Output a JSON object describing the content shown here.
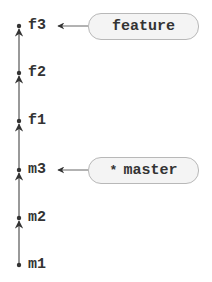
{
  "diagram": {
    "type": "git-commit-graph",
    "commits": [
      {
        "id": "f3",
        "label": "f3",
        "y": 26
      },
      {
        "id": "f2",
        "label": "f2",
        "y": 73
      },
      {
        "id": "f1",
        "label": "f1",
        "y": 121
      },
      {
        "id": "m3",
        "label": "m3",
        "y": 170
      },
      {
        "id": "m2",
        "label": "m2",
        "y": 218
      },
      {
        "id": "m1",
        "label": "m1",
        "y": 265
      }
    ],
    "edges": [
      {
        "from": "m1",
        "to": "m2"
      },
      {
        "from": "m2",
        "to": "m3"
      },
      {
        "from": "m3",
        "to": "f1"
      },
      {
        "from": "f1",
        "to": "f2"
      },
      {
        "from": "f2",
        "to": "f3"
      }
    ],
    "branches": [
      {
        "name": "feature",
        "points_to": "f3",
        "current": false,
        "marker": ""
      },
      {
        "name": "master",
        "points_to": "m3",
        "current": true,
        "marker": "*"
      }
    ],
    "colors": {
      "line": "#555555",
      "dot": "#333333",
      "pill_fill": "#f4f4f4",
      "pill_border": "#b8b8b8",
      "text": "#333333"
    }
  }
}
